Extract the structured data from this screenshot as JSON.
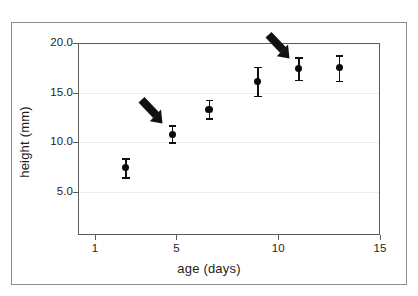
{
  "chart_data": {
    "type": "scatter",
    "title": "",
    "xlabel": "age (days)",
    "ylabel": "height (mm)",
    "xlim": [
      0,
      15.7
    ],
    "ylim": [
      2.5,
      20.0
    ],
    "xticks": [
      1,
      5,
      10,
      15
    ],
    "xtick_labels": [
      "1",
      "5",
      "10",
      "15"
    ],
    "yticks": [
      5.0,
      10.0,
      15.0,
      20.0
    ],
    "ytick_labels": [
      "5.0",
      "10.0",
      "15.0",
      "20.0"
    ],
    "grid": "horizontal-faint",
    "legend": "none",
    "marker": "filled-circle-with-error-bars",
    "series": [
      {
        "name": "height",
        "points": [
          {
            "x": 2.5,
            "y": 7.5,
            "yerr_low": 1.0,
            "yerr_high": 0.9
          },
          {
            "x": 4.8,
            "y": 10.8,
            "yerr_low": 0.8,
            "yerr_high": 0.9
          },
          {
            "x": 6.6,
            "y": 13.3,
            "yerr_low": 0.9,
            "yerr_high": 1.0
          },
          {
            "x": 9.0,
            "y": 16.1,
            "yerr_low": 1.4,
            "yerr_high": 1.5
          },
          {
            "x": 11.0,
            "y": 17.4,
            "yerr_low": 1.1,
            "yerr_high": 1.2
          },
          {
            "x": 13.0,
            "y": 17.5,
            "yerr_low": 1.3,
            "yerr_high": 1.3
          }
        ]
      }
    ],
    "annotations": [
      {
        "name": "arrow-1",
        "label": "",
        "points_to_x": 4.8,
        "points_to_y": 10.8,
        "direction": "down-right"
      },
      {
        "name": "arrow-2",
        "label": "",
        "points_to_x": 11.0,
        "points_to_y": 17.4,
        "direction": "down-right"
      }
    ],
    "colors": {
      "marker": "#0a0a0a",
      "error_bar": "#111111",
      "axis": "#5a5a5a",
      "outer_frame": "#8d8d8d",
      "gridline": "#ededed",
      "text": "#1d1d1d",
      "background": "#ffffff",
      "annotation_arrow": "#111111"
    }
  }
}
